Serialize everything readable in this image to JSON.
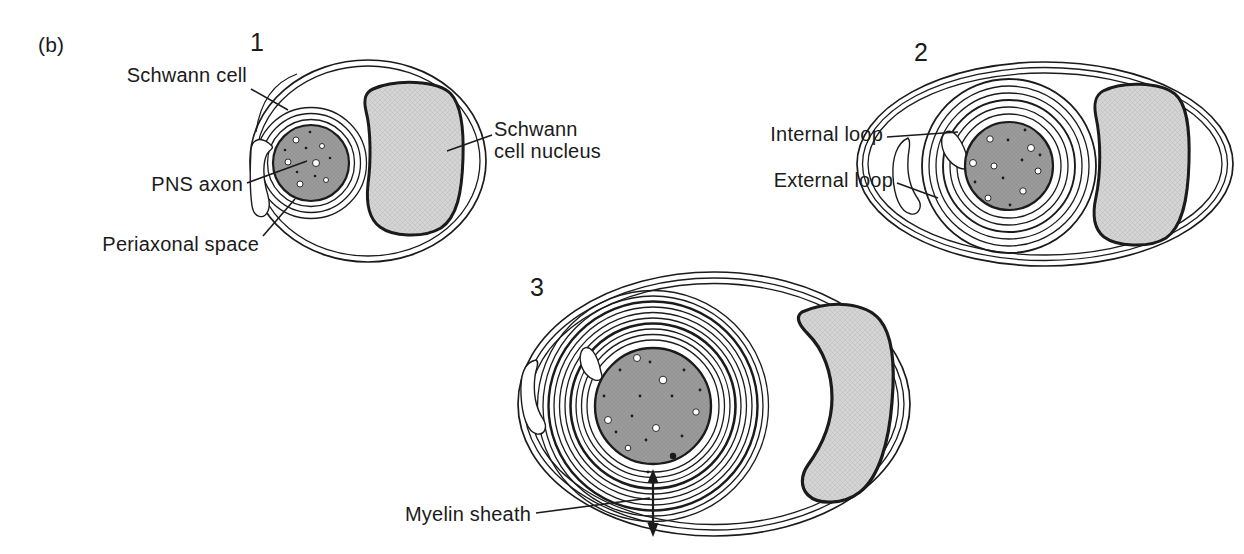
{
  "panel": {
    "label": "(b)"
  },
  "stages": {
    "s1": "1",
    "s2": "2",
    "s3": "3"
  },
  "labels": {
    "schwann_cell": "Schwann cell",
    "pns_axon": "PNS axon",
    "periaxonal_space": "Periaxonal space",
    "schwann_cell_nucleus": "Schwann\ncell nucleus",
    "internal_loop": "Internal loop",
    "external_loop": "External loop",
    "myelin_sheath": "Myelin sheath"
  },
  "colors": {
    "line": "#1b1b1b",
    "axon_fill": "#9c9c9c",
    "nucleus_fill": "#d4d4d4",
    "background": "#ffffff"
  }
}
